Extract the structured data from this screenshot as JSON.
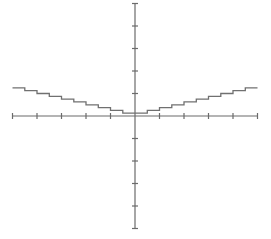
{
  "chart_data": {
    "type": "line",
    "title": "",
    "xlabel": "",
    "ylabel": "",
    "xlim": [
      -5,
      5
    ],
    "ylim": [
      -5,
      5
    ],
    "grid": false,
    "legend": null,
    "x_ticks": [
      -5,
      -4,
      -3,
      -2,
      -1,
      0,
      1,
      2,
      3,
      4,
      5
    ],
    "y_ticks": [
      -5,
      -4,
      -3,
      -2,
      -1,
      0,
      1,
      2,
      3,
      4,
      5
    ],
    "tick_labels_shown": false,
    "series": [
      {
        "name": "step function",
        "step": "post",
        "x": [
          -5,
          -4.5,
          -4,
          -3.5,
          -3,
          -2.5,
          -2,
          -1.5,
          -1,
          -0.5,
          0,
          0.5,
          1,
          1.5,
          2,
          2.5,
          3,
          3.5,
          4,
          4.5,
          5
        ],
        "y": [
          1.25,
          1.125,
          1.0,
          0.875,
          0.75,
          0.625,
          0.5,
          0.375,
          0.25,
          0.125,
          0,
          0.125,
          0.25,
          0.375,
          0.5,
          0.625,
          0.75,
          0.875,
          1.0,
          1.125,
          1.25
        ]
      }
    ],
    "colors": {
      "axis": "#6b6b6b",
      "curve": "#707070",
      "background": "#ffffff"
    }
  },
  "layout": {
    "origin_px": [
      135,
      116
    ],
    "x_unit_px": 24.5,
    "y_unit_px": 22.5
  }
}
